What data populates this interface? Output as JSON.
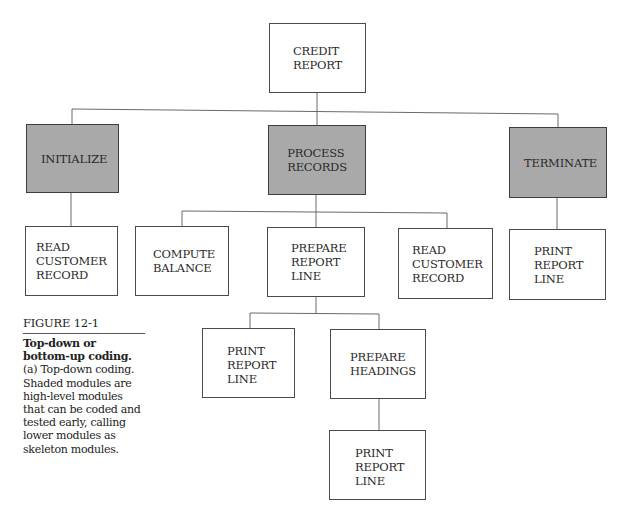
{
  "diagram": {
    "type": "hierarchy-chart",
    "colors": {
      "shaded_fill": "#a9a9a9",
      "plain_fill": "#ffffff",
      "line": "#555555"
    },
    "root": {
      "id": "credit-report",
      "lines": [
        "CREDIT",
        "REPORT"
      ],
      "shaded": false
    },
    "level1": [
      {
        "id": "initialize",
        "lines": [
          "INITIALIZE"
        ],
        "shaded": true
      },
      {
        "id": "process-records",
        "lines": [
          "PROCESS",
          "RECORDS"
        ],
        "shaded": true
      },
      {
        "id": "terminate",
        "lines": [
          "TERMINATE"
        ],
        "shaded": true
      }
    ],
    "level2": [
      {
        "id": "read-customer-record-1",
        "parent": "initialize",
        "lines": [
          "READ",
          "CUSTOMER",
          "RECORD"
        ],
        "shaded": false
      },
      {
        "id": "compute-balance",
        "parent": "process-records",
        "lines": [
          "COMPUTE",
          "BALANCE"
        ],
        "shaded": false
      },
      {
        "id": "prepare-report-line",
        "parent": "process-records",
        "lines": [
          "PREPARE",
          "REPORT",
          "LINE"
        ],
        "shaded": false
      },
      {
        "id": "read-customer-record-2",
        "parent": "process-records",
        "lines": [
          "READ",
          "CUSTOMER",
          "RECORD"
        ],
        "shaded": false
      },
      {
        "id": "print-report-line-1",
        "parent": "terminate",
        "lines": [
          "PRINT",
          "REPORT",
          "LINE"
        ],
        "shaded": false
      }
    ],
    "level3": [
      {
        "id": "print-report-line-2",
        "parent": "prepare-report-line",
        "lines": [
          "PRINT",
          "REPORT",
          "LINE"
        ],
        "shaded": false
      },
      {
        "id": "prepare-headings",
        "parent": "prepare-report-line",
        "lines": [
          "PREPARE",
          "HEADINGS"
        ],
        "shaded": false
      }
    ],
    "level4": [
      {
        "id": "print-report-line-3",
        "parent": "prepare-headings",
        "lines": [
          "PRINT",
          "REPORT",
          "LINE"
        ],
        "shaded": false
      }
    ]
  },
  "caption": {
    "figure_label": "FIGURE 12-1",
    "title": "Top-down or bottom-up coding.",
    "title_part1": "Top-down or bottom-",
    "title_part2": "up coding.",
    "text": " (a) Top-down coding. Shaded modules are high-level modules that can be coded and tested early, calling lower modules as skeleton modules."
  }
}
